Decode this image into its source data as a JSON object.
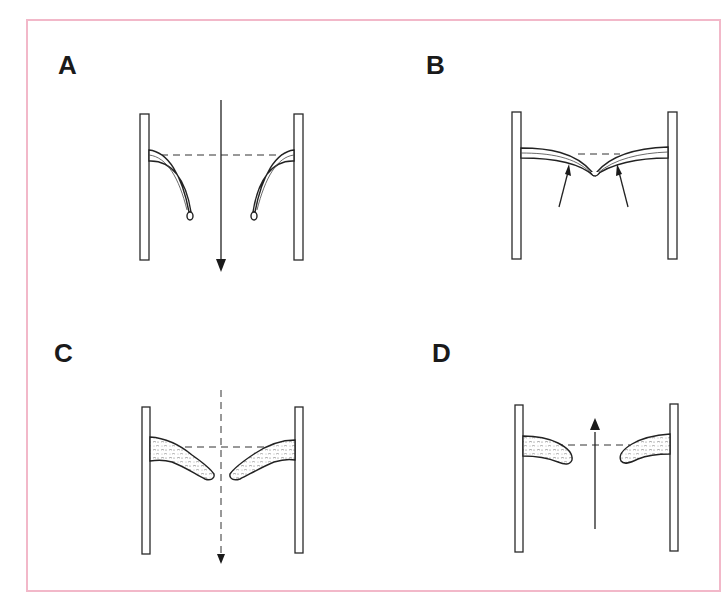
{
  "figure": {
    "frame_color": "#f2b8c9",
    "panels": [
      {
        "id": "A",
        "label": "A",
        "description": "Thin membranes attached to parallel plates droop downward; solid arrow points down through the gap"
      },
      {
        "id": "B",
        "label": "B",
        "description": "Thin membranes meet in the center forming a V; two arrows point up toward the membranes"
      },
      {
        "id": "C",
        "label": "C",
        "description": "Thick textured masses angle downward toward center; dashed arrow points down"
      },
      {
        "id": "D",
        "label": "D",
        "description": "Thick textured masses horizontal with a gap; solid arrow points up through the gap"
      }
    ]
  }
}
